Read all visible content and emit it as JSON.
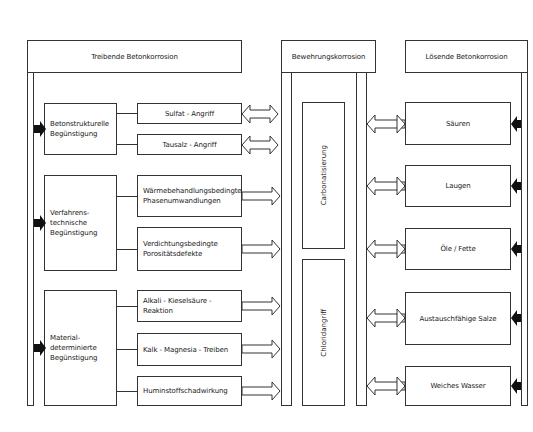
{
  "headers": {
    "left": "Treibende Betonkorrosion",
    "center": "Bewehrungskorrosion",
    "right": "Lösende Betonkorrosion"
  },
  "left_groups": [
    {
      "label": "Betonstrukturelle Begünstigung",
      "items": [
        "Sulfat - Angriff",
        "Tausalz - Angriff"
      ]
    },
    {
      "label": "Verfahrens-technische Begünstigung",
      "items": [
        "Wärmebehandlungsbedingte Phasenumwandlungen",
        "Verdichtungsbedingte Porositätsdefekte"
      ]
    },
    {
      "label": "Material-determinierte Begünstigung",
      "items": [
        "Alkali - Kieselsäure - Reaktion",
        "Kalk - Magnesia - Treiben",
        "Huminstoffschadwirkung"
      ]
    }
  ],
  "center_boxes": [
    "Carbonatisierung",
    "Chloridangriff"
  ],
  "right_items": [
    "Säuren",
    "Laugen",
    "Öle / Fette",
    "Austauschfähige Salze",
    "Weiches Wasser"
  ],
  "colors": {
    "line": "#333333",
    "background": "#ffffff",
    "arrow_fill": "#111111"
  }
}
